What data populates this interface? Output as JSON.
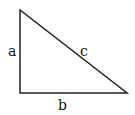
{
  "diagram": {
    "type": "right-triangle",
    "stroke_color": "#222222",
    "vertices": {
      "top": [
        20,
        10
      ],
      "right_angle": [
        20,
        93
      ],
      "right": [
        127,
        93
      ]
    },
    "labels": {
      "vertical_side": "a",
      "horizontal_side": "b",
      "hypotenuse": "c"
    }
  }
}
